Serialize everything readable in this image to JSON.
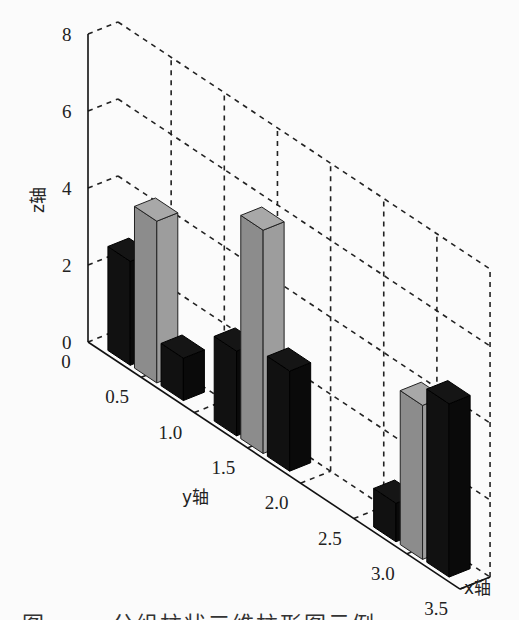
{
  "chart_data": {
    "type": "bar3",
    "title": "",
    "xlabel": "x轴",
    "ylabel": "y轴",
    "zlabel": "z轴",
    "zlim": [
      0,
      8
    ],
    "ylim": [
      0,
      3.5
    ],
    "z_ticks": [
      "0",
      "2",
      "4",
      "6",
      "8"
    ],
    "y_ticks": [
      "0",
      "0.5",
      "1.0",
      "1.5",
      "2.0",
      "2.5",
      "3.0",
      "3.5"
    ],
    "grid": true,
    "groups_y": [
      0.5,
      1.5,
      3.0
    ],
    "series": [
      {
        "name": "series 1",
        "color": "#111111",
        "values": [
          2.7,
          2.2,
          1.0
        ]
      },
      {
        "name": "series 2",
        "color": "#8c8c8c",
        "values": [
          4.2,
          5.8,
          4.0
        ]
      },
      {
        "name": "series 3",
        "color": "#111111",
        "values": [
          1.1,
          2.6,
          4.5
        ]
      }
    ]
  },
  "caption": "图 ……  分组柱状三维柱形图示例"
}
